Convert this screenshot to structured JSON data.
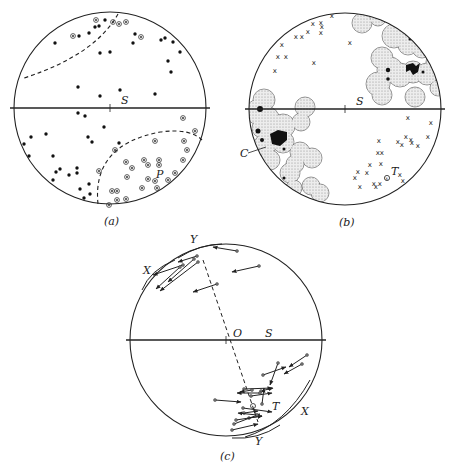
{
  "figure": {
    "header_partial": "",
    "panels": [
      {
        "id": "a",
        "caption": "(a)",
        "center": [
          110,
          108
        ],
        "radius": 96,
        "labels": [
          {
            "text": "S",
            "x": 121,
            "y": 104
          },
          {
            "text": "P",
            "x": 156,
            "y": 178
          }
        ],
        "dots": [
          [
            105,
            20
          ],
          [
            95,
            27
          ],
          [
            99,
            26
          ],
          [
            55,
            43
          ],
          [
            79,
            36
          ],
          [
            89,
            33
          ],
          [
            100,
            53
          ],
          [
            110,
            52
          ],
          [
            135,
            34
          ],
          [
            133,
            43
          ],
          [
            161,
            40
          ],
          [
            165,
            38
          ],
          [
            173,
            42
          ],
          [
            180,
            52
          ],
          [
            168,
            61
          ],
          [
            171,
            72
          ],
          [
            78,
            87
          ],
          [
            100,
            96
          ],
          [
            120,
            90
          ],
          [
            155,
            94
          ],
          [
            78,
            113
          ],
          [
            85,
            116
          ],
          [
            104,
            127
          ],
          [
            31,
            137
          ],
          [
            24,
            144
          ],
          [
            46,
            134
          ],
          [
            88,
            137
          ],
          [
            92,
            142
          ],
          [
            29,
            156
          ],
          [
            53,
            156
          ],
          [
            119,
            143
          ],
          [
            56,
            172
          ],
          [
            60,
            169
          ],
          [
            69,
            175
          ],
          [
            77,
            168
          ],
          [
            77,
            173
          ],
          [
            53,
            180
          ],
          [
            89,
            184
          ],
          [
            80,
            189
          ],
          [
            84,
            198
          ],
          [
            90,
            194
          ]
        ],
        "circled_dots": [
          [
            96,
            20
          ],
          [
            113,
            22
          ],
          [
            119,
            24
          ],
          [
            126,
            22
          ],
          [
            73,
            36
          ],
          [
            141,
            37
          ],
          [
            183,
            118
          ],
          [
            195,
            131
          ],
          [
            155,
            141
          ],
          [
            184,
            141
          ],
          [
            115,
            150
          ],
          [
            126,
            162
          ],
          [
            132,
            168
          ],
          [
            144,
            160
          ],
          [
            148,
            165
          ],
          [
            159,
            160
          ],
          [
            159,
            165
          ],
          [
            187,
            150
          ],
          [
            183,
            160
          ],
          [
            99,
            171
          ],
          [
            127,
            177
          ],
          [
            148,
            179
          ],
          [
            155,
            181
          ],
          [
            168,
            180
          ],
          [
            175,
            173
          ],
          [
            142,
            188
          ],
          [
            157,
            188
          ],
          [
            112,
            191
          ],
          [
            117,
            191
          ],
          [
            117,
            200
          ],
          [
            126,
            199
          ],
          [
            109,
            205
          ]
        ],
        "dashed_curves": [
          "M 118 14 Q 95 55 24 78",
          "M 98 204 Q 92 145 160 132 Q 190 128 202 140"
        ]
      },
      {
        "id": "b",
        "caption": "(b)",
        "center": [
          345,
          109
        ],
        "radius": 96,
        "labels": [
          {
            "text": "S",
            "x": 356,
            "y": 105
          },
          {
            "text": "C",
            "x": 240,
            "y": 157
          },
          {
            "text": "T",
            "x": 391,
            "y": 175
          }
        ],
        "x_marks": [
          [
            332,
            15
          ],
          [
            313,
            23
          ],
          [
            321,
            22
          ],
          [
            322,
            26
          ],
          [
            308,
            31
          ],
          [
            321,
            32
          ],
          [
            296,
            36
          ],
          [
            302,
            36
          ],
          [
            282,
            44
          ],
          [
            350,
            42
          ],
          [
            278,
            56
          ],
          [
            286,
            56
          ],
          [
            314,
            62
          ],
          [
            275,
            70
          ],
          [
            408,
            117
          ],
          [
            431,
            122
          ],
          [
            428,
            136
          ],
          [
            379,
            140
          ],
          [
            398,
            141
          ],
          [
            402,
            144
          ],
          [
            412,
            142
          ],
          [
            411,
            139
          ],
          [
            406,
            136
          ],
          [
            418,
            145
          ],
          [
            378,
            152
          ],
          [
            382,
            152
          ],
          [
            358,
            171
          ],
          [
            355,
            177
          ],
          [
            370,
            164
          ],
          [
            367,
            172
          ],
          [
            381,
            163
          ],
          [
            400,
            174
          ],
          [
            403,
            180
          ],
          [
            360,
            186
          ],
          [
            374,
            183
          ],
          [
            376,
            186
          ],
          [
            380,
            183
          ]
        ],
        "circled_mark": [
          387,
          178
        ],
        "stipple_blobs": [
          {
            "cx": 362,
            "cy": 23,
            "r": 10
          },
          {
            "cx": 378,
            "cy": 18,
            "r": 8
          },
          {
            "cx": 394,
            "cy": 36,
            "r": 12
          },
          {
            "cx": 408,
            "cy": 45,
            "r": 10
          },
          {
            "cx": 422,
            "cy": 48,
            "r": 10
          },
          {
            "cx": 436,
            "cy": 62,
            "r": 10
          },
          {
            "cx": 382,
            "cy": 58,
            "r": 11
          },
          {
            "cx": 390,
            "cy": 70,
            "r": 13
          },
          {
            "cx": 400,
            "cy": 75,
            "r": 12
          },
          {
            "cx": 413,
            "cy": 72,
            "r": 11
          },
          {
            "cx": 427,
            "cy": 74,
            "r": 11
          },
          {
            "cx": 378,
            "cy": 84,
            "r": 12
          },
          {
            "cx": 382,
            "cy": 95,
            "r": 10
          },
          {
            "cx": 438,
            "cy": 88,
            "r": 8
          },
          {
            "cx": 415,
            "cy": 97,
            "r": 10
          },
          {
            "cx": 264,
            "cy": 100,
            "r": 11
          },
          {
            "cx": 257,
            "cy": 112,
            "r": 12
          },
          {
            "cx": 268,
            "cy": 118,
            "r": 11
          },
          {
            "cx": 283,
            "cy": 126,
            "r": 12
          },
          {
            "cx": 276,
            "cy": 135,
            "r": 10
          },
          {
            "cx": 283,
            "cy": 142,
            "r": 11
          },
          {
            "cx": 262,
            "cy": 128,
            "r": 10
          },
          {
            "cx": 265,
            "cy": 145,
            "r": 11
          },
          {
            "cx": 270,
            "cy": 160,
            "r": 10
          },
          {
            "cx": 305,
            "cy": 107,
            "r": 10
          },
          {
            "cx": 301,
            "cy": 122,
            "r": 9
          },
          {
            "cx": 300,
            "cy": 152,
            "r": 10
          },
          {
            "cx": 312,
            "cy": 158,
            "r": 10
          },
          {
            "cx": 295,
            "cy": 164,
            "r": 9
          },
          {
            "cx": 290,
            "cy": 173,
            "r": 10
          },
          {
            "cx": 311,
            "cy": 186,
            "r": 9
          },
          {
            "cx": 320,
            "cy": 193,
            "r": 9
          },
          {
            "cx": 294,
            "cy": 188,
            "r": 8
          }
        ],
        "solid_blobs": [
          {
            "path": "M 406 65 L 413 63 L 416 66 L 420 63 L 418 72 L 413 75 L 410 70 L 406 72 Z"
          },
          {
            "path": "M 270 134 L 278 130 L 287 132 L 287 140 L 280 146 L 272 144 Z"
          },
          {
            "cx": 410,
            "cy": 39,
            "r": 1.5
          },
          {
            "cx": 388,
            "cy": 70,
            "r": 2.2
          },
          {
            "cx": 388,
            "cy": 79,
            "r": 1.8
          },
          {
            "cx": 423,
            "cy": 72,
            "r": 1.5
          },
          {
            "cx": 260,
            "cy": 109,
            "r": 3
          },
          {
            "cx": 258,
            "cy": 131,
            "r": 2.5
          },
          {
            "cx": 262,
            "cy": 140,
            "r": 2
          },
          {
            "cx": 284,
            "cy": 149,
            "r": 1.5
          },
          {
            "cx": 284,
            "cy": 178,
            "r": 1.5
          }
        ],
        "leader": "M 248 153 L 266 147"
      },
      {
        "id": "c",
        "caption": "(c)",
        "center": [
          226,
          340
        ],
        "radius": 96,
        "labels": [
          {
            "text": "O",
            "x": 233,
            "y": 337
          },
          {
            "text": "S",
            "x": 265,
            "y": 337
          },
          {
            "text": "Y",
            "x": 190,
            "y": 243
          },
          {
            "text": "X",
            "x": 143,
            "y": 274
          },
          {
            "text": "T",
            "x": 272,
            "y": 410
          },
          {
            "text": "X",
            "x": 301,
            "y": 415
          },
          {
            "text": "Y",
            "x": 255,
            "y": 445
          }
        ],
        "arrows": [
          [
            237,
            251,
            213,
            247
          ],
          [
            259,
            266,
            232,
            272
          ],
          [
            217,
            284,
            193,
            292
          ],
          [
            198,
            262,
            160,
            291
          ],
          [
            194,
            259,
            168,
            282
          ],
          [
            197,
            256,
            178,
            262
          ],
          [
            183,
            265,
            153,
            275
          ],
          [
            180,
            267,
            156,
            289
          ],
          [
            307,
            355,
            289,
            367
          ],
          [
            278,
            363,
            270,
            385
          ],
          [
            302,
            364,
            284,
            374
          ],
          [
            263,
            375,
            286,
            367
          ],
          [
            244,
            389,
            272,
            388
          ],
          [
            252,
            390,
            240,
            392
          ],
          [
            261,
            391,
            273,
            388
          ],
          [
            251,
            396,
            272,
            393
          ],
          [
            215,
            400,
            241,
            402
          ],
          [
            260,
            393,
            237,
            393
          ],
          [
            243,
            408,
            272,
            412
          ],
          [
            262,
            404,
            264,
            388
          ],
          [
            244,
            413,
            258,
            411
          ],
          [
            249,
            418,
            262,
            416
          ],
          [
            236,
            420,
            262,
            416
          ],
          [
            234,
            424,
            260,
            414
          ],
          [
            232,
            430,
            258,
            424
          ],
          [
            257,
            415,
            238,
            413
          ]
        ],
        "dashed_line": [
          203,
          260,
          258,
          422
        ],
        "brackets": [
          "M 142 290 Q 150 270 175 260",
          "M 178 258 Q 200 244 222 244",
          "M 245 437 Q 285 425 310 380",
          "M 232 438 Q 258 440 280 425"
        ]
      }
    ]
  }
}
